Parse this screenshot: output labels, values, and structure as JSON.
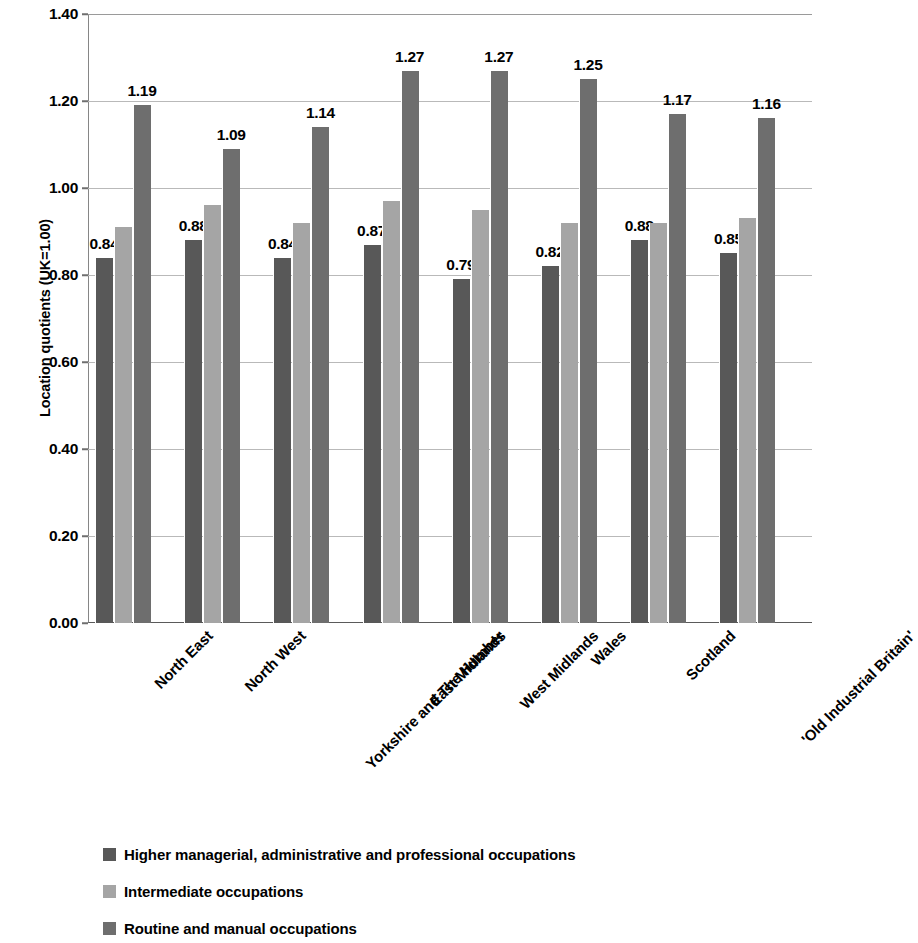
{
  "chart_data": {
    "type": "bar",
    "title": "",
    "xlabel": "",
    "ylabel": "Location quotients (UK=1.00)",
    "ylim": [
      0.0,
      1.4
    ],
    "ytick_labels": [
      "1.40",
      "1.20",
      "1.00",
      "0.80",
      "0.60",
      "0.40",
      "0.20",
      "0.00"
    ],
    "ytick_values": [
      1.4,
      1.2,
      1.0,
      0.8,
      0.6,
      0.4,
      0.2,
      0.0
    ],
    "grid": true,
    "legend_position": "bottom-left",
    "categories": [
      "North East",
      "North West",
      "Yorkshire and The Humber",
      "East Midlands",
      "West Midlands",
      "Wales",
      "Scotland",
      "'Old Industrial Britain'"
    ],
    "series": [
      {
        "name": "Higher managerial, administrative and professional occupations",
        "color": "#585858",
        "values": [
          0.84,
          0.88,
          0.84,
          0.87,
          0.79,
          0.82,
          0.88,
          0.85
        ],
        "labels": [
          "0.84",
          "0.88",
          "0.84",
          "0.87",
          "0.79",
          "0.82",
          "0.88",
          "0.85"
        ],
        "labels_shown": true
      },
      {
        "name": "Intermediate occupations",
        "color": "#a5a5a5",
        "values": [
          0.91,
          0.96,
          0.92,
          0.97,
          0.95,
          0.92,
          0.92,
          0.93
        ],
        "labels": [
          "",
          "",
          "",
          "",
          "",
          "",
          "",
          ""
        ],
        "labels_shown": false
      },
      {
        "name": "Routine and manual occupations",
        "color": "#6e6e6e",
        "values": [
          1.19,
          1.09,
          1.14,
          1.27,
          1.27,
          1.25,
          1.17,
          1.16
        ],
        "labels": [
          "1.19",
          "1.09",
          "1.14",
          "1.27",
          "1.27",
          "1.25",
          "1.17",
          "1.16"
        ],
        "labels_shown": true
      }
    ]
  }
}
